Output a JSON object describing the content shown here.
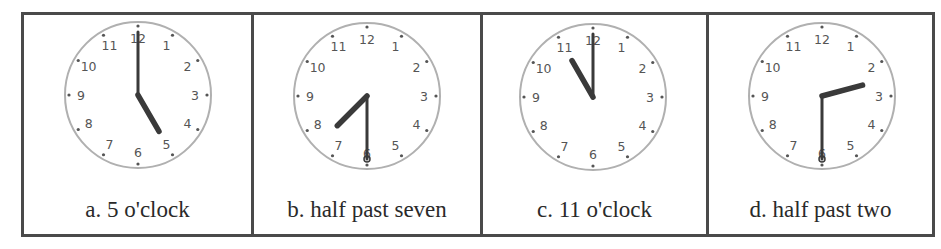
{
  "figure": {
    "title": "",
    "colors": {
      "border": "#4a4a4a",
      "clock_rim": "#b0b0b0",
      "hands": "#3a3a3a",
      "numerals": "#555555",
      "label_text": "#2a2a2a"
    },
    "numerals": [
      "12",
      "1",
      "2",
      "3",
      "4",
      "5",
      "6",
      "7",
      "8",
      "9",
      "10",
      "11"
    ],
    "panels": [
      {
        "id": "a",
        "label": "a. 5 o'clock",
        "hour": 5,
        "minute": 0
      },
      {
        "id": "b",
        "label": "b. half past seven",
        "hour": 7,
        "minute": 30
      },
      {
        "id": "c",
        "label": "c. 11 o'clock",
        "hour": 11,
        "minute": 0
      },
      {
        "id": "d",
        "label": "d. half past two",
        "hour": 2,
        "minute": 30
      }
    ]
  }
}
